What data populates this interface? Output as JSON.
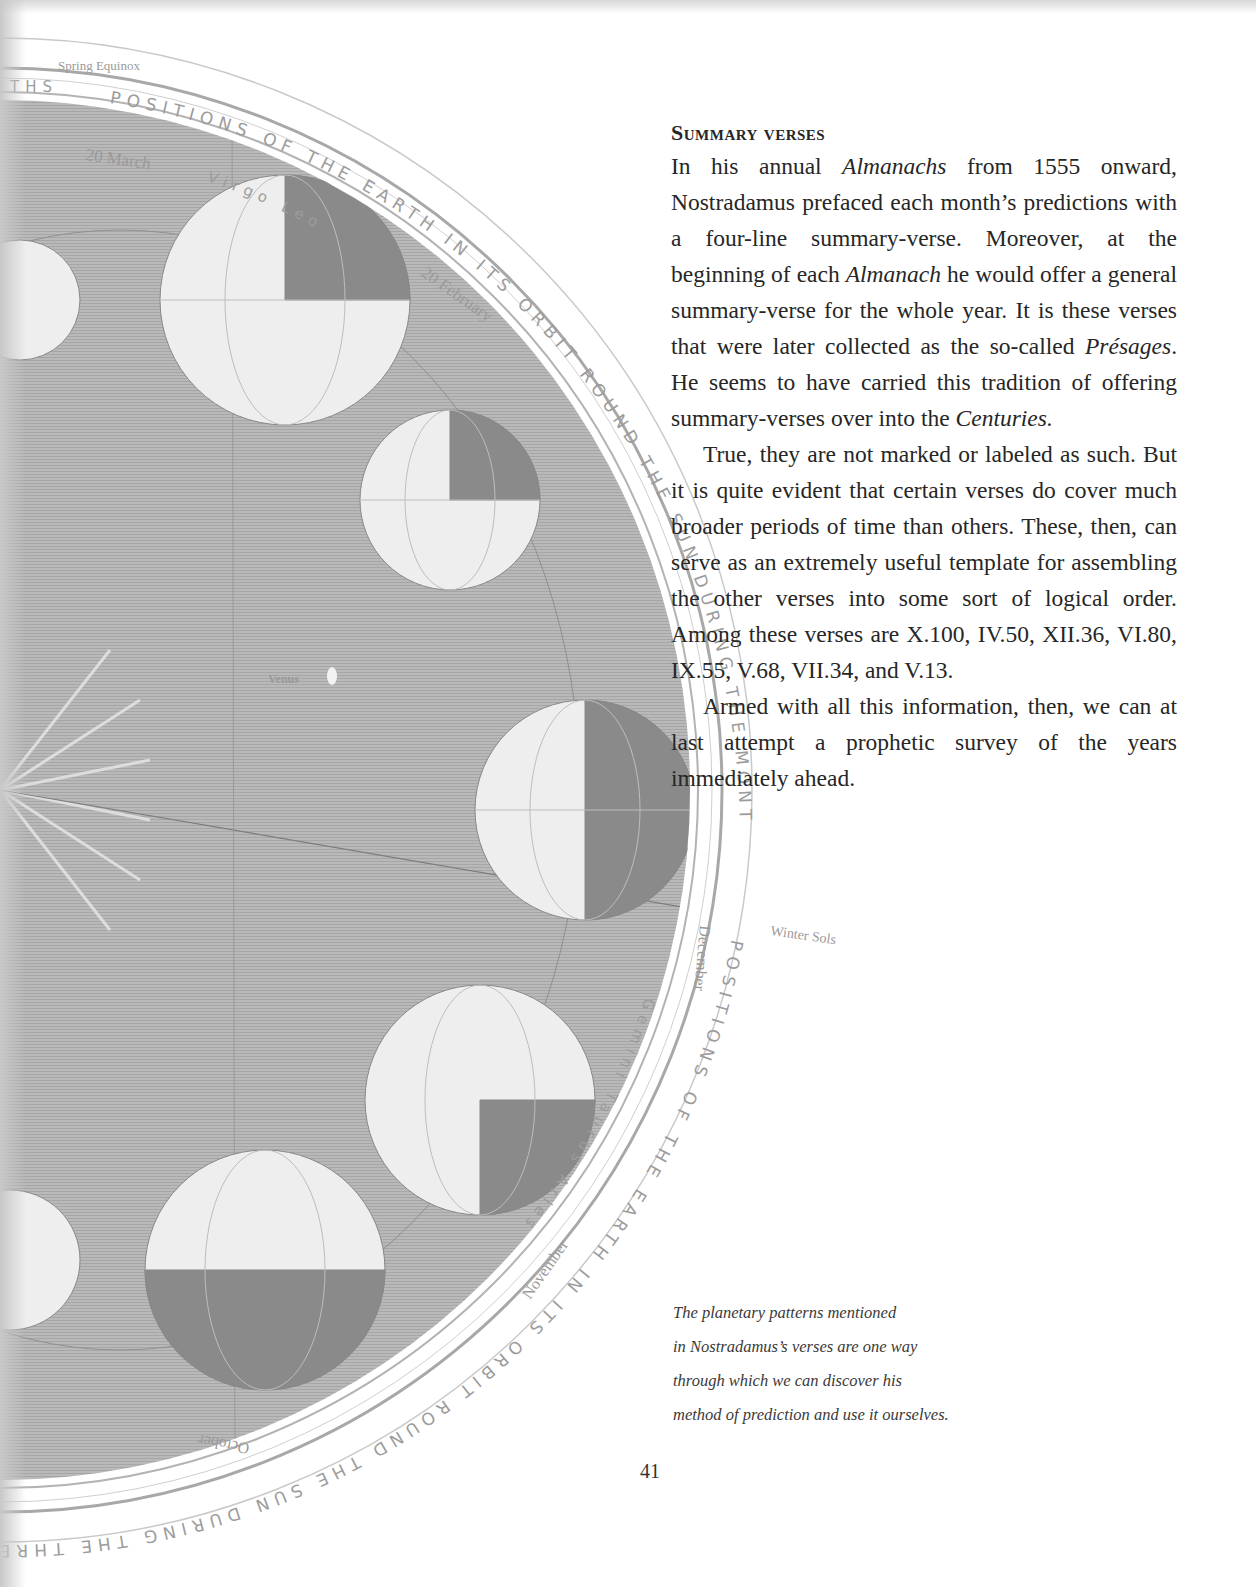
{
  "illustration": {
    "labels": {
      "spring_equinox": "Spring Equinox",
      "winter_solstice": "Winter Sols",
      "venus": "Venus",
      "march": "20 March",
      "february": "20 February",
      "december": "December",
      "november": "November",
      "october": "October",
      "virgo": "Virgo",
      "leo": "Leo",
      "gemini": "Gemini",
      "taurus": "Taurus",
      "aries": "Aries"
    },
    "ring_text": {
      "top": "POSITIONS OF THE EARTH IN ITS ORBIT ROUND THE SUN DURING THE MONTHS",
      "bottom": "POSITIONS OF THE EARTH IN ITS ORBIT ROUND THE SUN DURING THE THREE AUTUMN",
      "ths": "THS"
    },
    "tick_numbers": [
      "25",
      "10",
      "5",
      "28",
      "25",
      "20",
      "30",
      "25",
      "25",
      "5",
      "30",
      "25",
      "10",
      "5",
      "25",
      "10"
    ]
  },
  "article": {
    "heading": "Summary verses",
    "paragraphs": [
      {
        "indent": false,
        "segments": [
          {
            "text": "In his annual ",
            "italic": false
          },
          {
            "text": "Almanachs",
            "italic": true
          },
          {
            "text": " from 1555 onward, Nostradamus prefaced each month’s predictions with a four-line summary-verse. Moreover, at the beginning of each ",
            "italic": false
          },
          {
            "text": "Almanach",
            "italic": true
          },
          {
            "text": " he would offer a general summary-verse for the whole year. It is these verses that were later collected as the so-called ",
            "italic": false
          },
          {
            "text": "Présages",
            "italic": true
          },
          {
            "text": ". He seems to have carried this tradition of offering summary-verses over into the ",
            "italic": false
          },
          {
            "text": "Centuries.",
            "italic": true
          }
        ]
      },
      {
        "indent": true,
        "segments": [
          {
            "text": "True, they are not marked or labeled as such. But it is quite evident that certain verses do cover much broader periods of time than others. These, then, can serve as an extremely useful template for assembling the other verses into some sort of logical order. Among these verses are X.100, IV.50, XII.36, VI.80, IX.55, V.68, VII.34, and V.13.",
            "italic": false
          }
        ]
      },
      {
        "indent": true,
        "segments": [
          {
            "text": "Armed with all this information, then, we can at last attempt a prophetic survey of the years immediately ahead.",
            "italic": false
          }
        ]
      }
    ]
  },
  "caption": {
    "lines": [
      "The planetary patterns mentioned",
      "in Nostradamus’s verses are one way",
      "through which we can discover his",
      "method of prediction and use it ourselves."
    ]
  },
  "page_number": "41"
}
